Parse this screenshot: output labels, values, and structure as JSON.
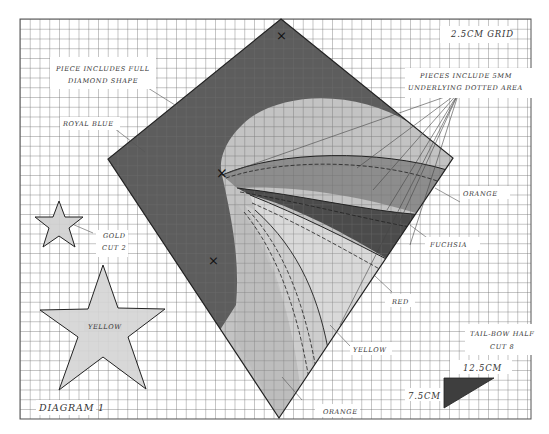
{
  "diagram": {
    "title": "Diagram 1",
    "grid_note": "2.5cm grid",
    "colors": {
      "grid_line": "#6a6a6a",
      "outline": "#222222",
      "royal_blue": "#5a5a5a",
      "orange": "#b9b9b9",
      "fuchsia": "#8c8c8c",
      "red": "#4a4a4a",
      "yellow": "#d9d9d9",
      "gold": "#cfcfcf",
      "star_yellow": "#d4d4d4",
      "tail_bow": "#3e3e3e"
    }
  },
  "labels": {
    "piece_full_line1": "PIECE INCLUDES FULL",
    "piece_full_line2": "DIAMOND SHAPE",
    "royal_blue": "ROYAL BLUE",
    "grid": "2.5CM GRID",
    "pieces_include_line1": "PIECES INCLUDE 5MM",
    "pieces_include_line2": "UNDERLYING DOTTED AREA",
    "orange_upper": "ORANGE",
    "fuchsia": "FUCHSIA",
    "red": "RED",
    "yellow_right": "YELLOW",
    "orange_lower": "ORANGE",
    "gold_line1": "GOLD",
    "gold_line2": "CUT 2",
    "yellow_star": "YELLOW",
    "tail_bow_line1": "TAIL-BOW HALF",
    "tail_bow_line2": "CUT 8",
    "dim_width": "12.5CM",
    "dim_height": "7.5CM",
    "diagram_title": "DIAGRAM 1"
  },
  "markers": {
    "cross_symbol": "×"
  }
}
